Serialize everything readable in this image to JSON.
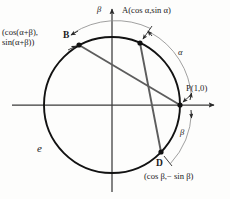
{
  "figure": {
    "circle_label": "e",
    "colors": {
      "circle_stroke": "#121212",
      "axis_stroke": "#3a3a3a",
      "chord_stroke": "#5a5a5a",
      "arc_stroke": "#8a8a8a",
      "text": "#1a1a1a",
      "background": "#fdfdfc"
    },
    "geometry": {
      "center_x": 112,
      "center_y": 105,
      "radius": 68,
      "outer_arc_radius": 80
    }
  },
  "points": [
    {
      "id": "A",
      "name_label": "A",
      "coord_label": "(cos α,sin α)",
      "full_label": "A(cos α,sin α)",
      "angle_deg": 66,
      "x": 140,
      "y": 43
    },
    {
      "id": "B",
      "name_label": "B",
      "coord_line1": "(cos(α+β),",
      "coord_line2": "sin(α+β))",
      "angle_deg": 119,
      "x": 79,
      "y": 45
    },
    {
      "id": "P",
      "name_label": "P",
      "coord_label": "(1,0)",
      "full_label": "P(1,0)",
      "angle_deg": 0,
      "x": 180,
      "y": 105
    },
    {
      "id": "D",
      "name_label": "D",
      "coord_label": "(cos β,− sin β)",
      "angle_deg": -44,
      "x": 161,
      "y": 152
    }
  ],
  "chords": [
    {
      "id": "chord-BP",
      "from": "B",
      "to": "P"
    },
    {
      "id": "chord-AD",
      "from": "A",
      "to": "D"
    }
  ],
  "arcs": [
    {
      "id": "arc-alpha",
      "label": "α",
      "from": "P",
      "to": "A",
      "label_x": 181,
      "label_y": 54
    },
    {
      "id": "arc-beta-lower",
      "label": "β",
      "from": "P",
      "to": "D",
      "label_x": 182,
      "label_y": 133
    },
    {
      "id": "arc-beta-upper",
      "label": "β",
      "from": "A",
      "to": "B",
      "label_x": 99,
      "label_y": 11
    }
  ],
  "axes": {
    "x_axis_label": "",
    "y_axis_label": "",
    "x_start_x": 12,
    "x_end_x": 218,
    "y_top_y": 4,
    "y_bottom_y": 192
  }
}
